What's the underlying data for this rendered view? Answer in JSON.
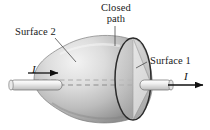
{
  "figure": {
    "background": "#ffffff",
    "width": 210,
    "height": 130
  },
  "labels": {
    "closed_path_line1": "Closed",
    "closed_path_line2": "path",
    "surface_2": "Surface 2",
    "surface_1": "Surface 1",
    "current_left": "I",
    "current_right": "I"
  },
  "colors": {
    "outline": "#3a3a3a",
    "closed_path_stroke": "#2b2b2b",
    "surface_light": "#e8e8e8",
    "surface_mid": "#c6c6c6",
    "surface_dark": "#9a9a9a",
    "cone_light": "#dcdcdc",
    "cone_dark": "#a8a8a8",
    "wire_fill": "#f2f2f2",
    "wire_stroke": "#6a6a6a",
    "dashed_wire": "#8c8c8c",
    "arrow": "#111111",
    "text": "#1a1a1a"
  },
  "geometry": {
    "closed_path_ellipse": {
      "cx": 133,
      "cy": 79,
      "rx": 18,
      "ry": 41
    },
    "wire_axis_y": 85,
    "left_wire": {
      "x1": 10,
      "x2": 62
    },
    "right_wire": {
      "x1": 140,
      "x2": 172
    },
    "left_arrow": {
      "x1": 28,
      "x2": 58,
      "y": 73
    },
    "right_arrow": {
      "x1": 168,
      "x2": 203,
      "y": 85
    }
  },
  "annotations": {
    "closed_path_leader": "vertical line from Closed path label to top of ellipse",
    "surface2_leader": "diagonal line from Surface 2 label to bullet-shaped surface",
    "surface1_leader": "diagonal line from Surface 1 label to cone surface"
  }
}
